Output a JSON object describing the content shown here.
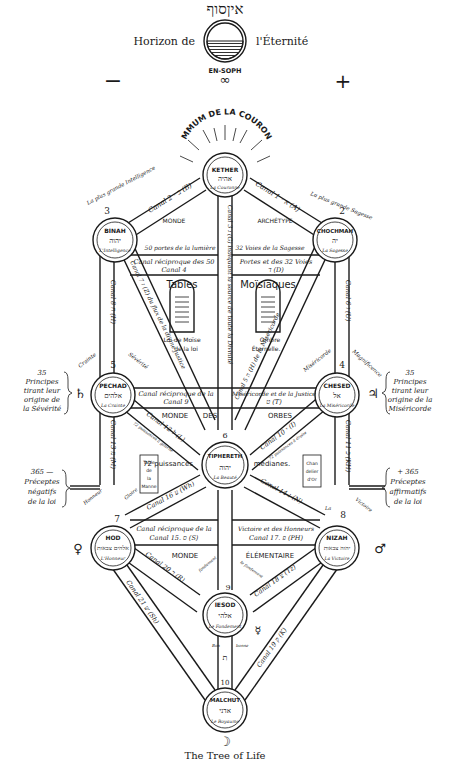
{
  "header": {
    "hebrew_title": "איןסוף",
    "horizon_left": "Horizon de",
    "horizon_right": "l'Éternité",
    "en_soph": "EN-SOPH",
    "infinity": "∞",
    "minus": "−",
    "plus": "+",
    "summum": "SUMMUM DE LA COURONNE"
  },
  "sephiroth": [
    {
      "id": "kether",
      "number": "1",
      "name": "KETHER",
      "hebrew": "אהיה",
      "title": "La Couronne"
    },
    {
      "id": "chochmah",
      "number": "2",
      "name": "CHOCHMAH",
      "hebrew": "יה",
      "title": "La Sagesse",
      "epithet": "La plus grande Sagesse"
    },
    {
      "id": "binah",
      "number": "3",
      "name": "BINAH",
      "hebrew": "יהוה",
      "title": "L'Intelligence",
      "epithet": "La plus grande Intelligence"
    },
    {
      "id": "chesed",
      "number": "4",
      "name": "CHESED",
      "hebrew": "אל",
      "title": "La Miséricorde"
    },
    {
      "id": "pechad",
      "number": "5",
      "name": "PECHAD",
      "hebrew": "אלהים",
      "title": "La Crainte"
    },
    {
      "id": "tiphereth",
      "number": "6",
      "name": "TIPHERETH",
      "hebrew": "יהוה",
      "title": "La Beauté"
    },
    {
      "id": "nizah",
      "number": "8",
      "name": "NIZAH",
      "hebrew": "יהוה צבאות",
      "title": "La Victoire"
    },
    {
      "id": "hod",
      "number": "7",
      "name": "HOD",
      "hebrew": "אלהים צבאות",
      "title": "L'Honneur"
    },
    {
      "id": "iesod",
      "number": "9",
      "name": "IESOD",
      "hebrew": "אלהי",
      "title": "Le Fondement"
    },
    {
      "id": "malchut",
      "number": "10",
      "name": "MALCHUT",
      "hebrew": "אדני",
      "title": "Le Royaume"
    }
  ],
  "canals": {
    "c1": "Canal 2 · ב (B)",
    "c2": "Canal 1 · א (A)",
    "c3": "Canal 3 ג (G) indiquant la source de toute la Divinité",
    "c4a": "Canal réciproque des 50",
    "c4b": "Canal 4",
    "c5a": "Portes et des 32 Voies",
    "c5b": "ד (D)",
    "c6": "Canal 6 ו (U)",
    "c7": "Canal 7 ז (Z) du flux de la divine justice",
    "c8": "Canal 8 ח (H)",
    "c9a": "Canal réciproque de la",
    "c9b": "Canal 9",
    "c9c": "Miséricorde et de la Justice",
    "c9d": "ט (T)",
    "c5": "Canal 5 ה (H) de la Miséricorde",
    "c10": "Canal 10 י (I)",
    "c11": "Canal 11 כ (KH)",
    "c12": "Canal 12 ל (L)",
    "c13": "Canal 13 מ (M)",
    "c14": "Canal 14 נ (N)",
    "c15a": "Canal réciproque de la",
    "c15b": "Canal 15. ס (S)",
    "c17a": "Victoire et des Honneurs",
    "c17b": "Canal 17. פ (PH)",
    "c16": "Canal 16 ע (Wh)",
    "c18": "Canal 18 צ (Tz)",
    "c19": "Canal 19 ק (K)",
    "c20": "Canal 20 ר (R)",
    "c21": "Canal 21 ש (Sh)",
    "c22": "ת"
  },
  "labels": {
    "monde_archetype_left": "MONDE",
    "monde_archetype_right": "ARCHÉTYPE",
    "portes50": "50 portes de la lumière",
    "voies32": "32 Voies de la Sagesse",
    "tables": "Tables",
    "moisiaques": "Moïsiaques",
    "loi_moise1": "Loi de Moïse",
    "loi_moise2": "de la loi",
    "ombre1": "Ombre",
    "ombre2": "Éternelle.",
    "monde_orbes_left": "MONDE",
    "monde_orbes_mid": "DES",
    "monde_orbes_right": "ORBES",
    "puissances_left": "72 puissances",
    "puissances_right": "médianes.",
    "puissances_gauche": "72 puissances à gauche",
    "puissances_droite": "72 puissances à droite",
    "table_manne": [
      "Table",
      "de",
      "la",
      "Manne"
    ],
    "chandelier": [
      "Chan",
      "delier",
      "d'Or"
    ],
    "crainte": "Crainte",
    "severite": "Sévérité",
    "misericorde": "Miséricorde",
    "magnificence": "Magnificence",
    "honneur": "Honneur",
    "gloire": "Gloire",
    "victoire": "Victoire",
    "la": "La",
    "monde_elem_left": "MONDE",
    "monde_elem_right": "ÉLÉMENTAIRE",
    "fondement": "fondement",
    "le_fondement": "le fondement",
    "bon": "Bon",
    "bonne": "bonne"
  },
  "side_notes": {
    "left_top": [
      "35",
      "Principes",
      "tirant leur",
      "origine de",
      "la Sévérité"
    ],
    "right_top": [
      "35",
      "Principes",
      "tirant leur",
      "origine de la",
      "Miséricorde"
    ],
    "left_bottom": [
      "365 —",
      "Préceptes",
      "négatifs",
      "de la loi"
    ],
    "right_bottom": [
      "+ 365",
      "Préceptes",
      "affirmatifs",
      "de la loi"
    ]
  },
  "planets": {
    "saturn": "♄",
    "jupiter": "♃",
    "venus": "♀",
    "mars": "♂",
    "mercury": "☿",
    "moon": "☽"
  },
  "caption": "The Tree of Life"
}
